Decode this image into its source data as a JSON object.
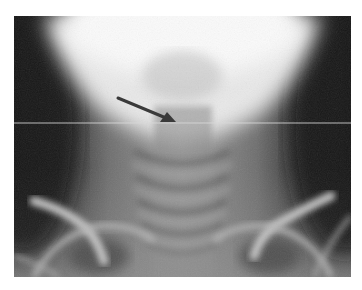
{
  "image": {
    "type": "radiograph",
    "view": "AP cervical spine / neck",
    "annotations": {
      "arrow": {
        "from": [
          104,
          82
        ],
        "to": [
          162,
          106
        ],
        "color": "#3a3a3a"
      },
      "scan_line": {
        "y": 107,
        "color": "#d8d8d8"
      }
    },
    "colors": {
      "background": "#ffffff",
      "bright_center": "#f4f4f4",
      "dark_sides": "#1e1e1e",
      "mid_tone": "#8a8a8a"
    }
  }
}
